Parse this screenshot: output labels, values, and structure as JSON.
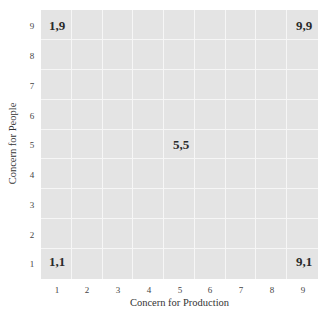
{
  "diagram": {
    "type": "managerial-grid",
    "x_axis": {
      "label": "Concern for Production",
      "ticks": [
        "1",
        "2",
        "3",
        "4",
        "5",
        "6",
        "7",
        "8",
        "9"
      ]
    },
    "y_axis": {
      "label": "Concern for People",
      "ticks": [
        "9",
        "8",
        "7",
        "6",
        "5",
        "4",
        "3",
        "2",
        "1"
      ]
    },
    "points": [
      {
        "label": "1,9",
        "x": 1,
        "y": 9
      },
      {
        "label": "9,9",
        "x": 9,
        "y": 9
      },
      {
        "label": "5,5",
        "x": 5,
        "y": 5
      },
      {
        "label": "1,1",
        "x": 1,
        "y": 1
      },
      {
        "label": "9,1",
        "x": 9,
        "y": 1
      }
    ],
    "colors": {
      "grid_bg": "#e4e4e4",
      "grid_lines": "#f6f6f6"
    }
  }
}
